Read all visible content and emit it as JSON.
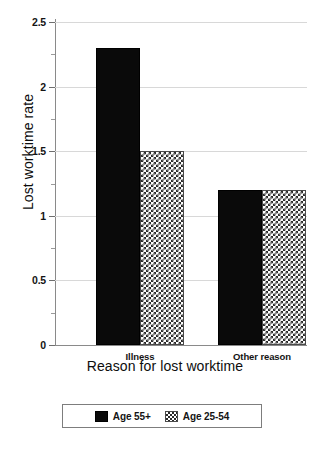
{
  "chart_data": {
    "type": "bar",
    "title": "",
    "xlabel": "Reason for lost worktime",
    "ylabel": "Lost worktime rate",
    "categories": [
      "Illness",
      "Other reason"
    ],
    "series": [
      {
        "name": "Age 55+",
        "values": [
          2.3,
          1.2
        ],
        "fill": "solid-black",
        "color": "#0a0a0a"
      },
      {
        "name": "Age 25-54",
        "values": [
          1.5,
          1.2
        ],
        "fill": "checkerboard",
        "color": "#2b2b2b"
      }
    ],
    "ylim": [
      0,
      2.5
    ],
    "ytick_labels": [
      "0",
      "0.5",
      "1",
      "1.5",
      "2",
      "2.5"
    ],
    "ytick_values": [
      0,
      0.5,
      1,
      1.5,
      2,
      2.5
    ],
    "yminor_tick_values": [
      0.25,
      0.75,
      1.25,
      1.75,
      2.25
    ],
    "grid": "horizontal-major",
    "legend_position": "bottom-center",
    "legend_border": true,
    "background": "#ffffff"
  }
}
